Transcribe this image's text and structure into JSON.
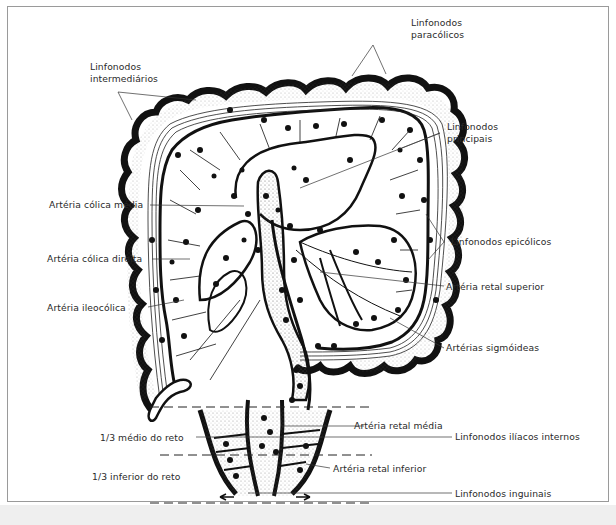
{
  "diagram": {
    "labels": {
      "paracolic_nodes": [
        "Linfonodos",
        "paracólicos"
      ],
      "intermediate_nodes": [
        "Linfonodos",
        "intermediários"
      ],
      "main_nodes": [
        "Linfonodos",
        "principais"
      ],
      "middle_colic_artery": "Artéria cólica média",
      "right_colic_artery": "Artéria cólica direita",
      "ileocolic_artery": "Artéria ileocólica",
      "epicolic_nodes": "Linfonodos epicólicos",
      "superior_rectal_artery": "Artéria retal superior",
      "sigmoid_arteries": "Artérias sigmóideas",
      "middle_rectal_artery": "Artéria retal média",
      "internal_iliac_nodes": "Linfonodos ilíacos internos",
      "inferior_rectal_artery": "Artéria retal inferior",
      "inguinal_nodes": "Linfonodos inguinais",
      "middle_third_rectum": "1/3 médio do reto",
      "lower_third_rectum": "1/3 inferior do reto"
    },
    "colors": {
      "ink": "#111111",
      "label_text": "#2a2a2a",
      "frame_border": "#9a9a9a",
      "background": "#ffffff"
    }
  }
}
